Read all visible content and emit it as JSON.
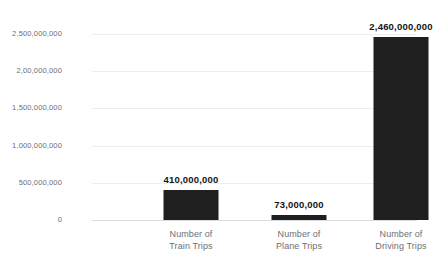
{
  "chart_data": {
    "type": "bar",
    "title": "",
    "subtitle": "",
    "xlabel": "",
    "ylabel": "",
    "grid": true,
    "legend": "none",
    "ylim": [
      0,
      2500000000
    ],
    "categories": [
      {
        "line1": "Number of",
        "line2": "Train Trips"
      },
      {
        "line1": "Number of",
        "line2": "Plane Trips"
      },
      {
        "line1": "Number of",
        "line2": "Driving Trips"
      }
    ],
    "values": [
      410000000,
      73000000,
      2460000000
    ],
    "value_labels": [
      "410,000,000",
      "73,000,000",
      "2,460,000,000"
    ],
    "y_ticks": [
      {
        "value": 0,
        "label": "0"
      },
      {
        "value": 500000000,
        "label": "500,000,000"
      },
      {
        "value": 1000000000,
        "label": "1,000,000,000"
      },
      {
        "value": 1500000000,
        "label": "1,500,000,000"
      },
      {
        "value": 2000000000,
        "label": "2,00,000,000"
      },
      {
        "value": 2500000000,
        "label": "2,500,000,000"
      }
    ],
    "colors": {
      "bar": "#1f1f1f",
      "gridline": "#ededf0",
      "axis": "#dcdce0",
      "tick_text": "#6e6e73",
      "value_text": "#141414",
      "background": "#ffffff"
    }
  }
}
